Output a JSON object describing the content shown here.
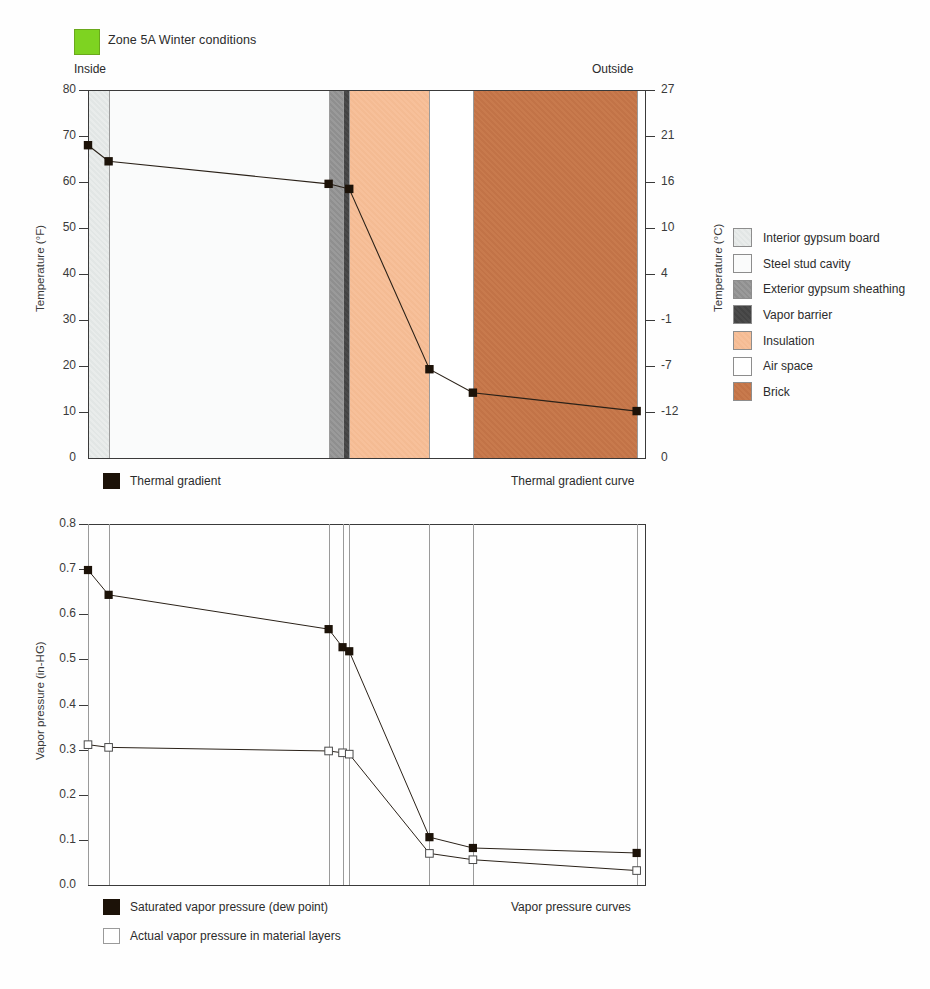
{
  "header": {
    "zone_label": "Zone 5A   Winter conditions",
    "zone_swatch_color": "#7ed321",
    "inside_label": "Inside",
    "outside_label": "Outside"
  },
  "material_legend": {
    "items": [
      {
        "label": "Interior gypsum board",
        "color": "#e6eae9",
        "swatch": "mat-gyp-int"
      },
      {
        "label": "Steel stud cavity",
        "color": "#fafbfb",
        "swatch": "mat-stud"
      },
      {
        "label": "Exterior gypsum sheathing",
        "color": "#959595",
        "swatch": "mat-gyp-ext"
      },
      {
        "label": "Vapor barrier",
        "color": "#474747",
        "swatch": "mat-vb"
      },
      {
        "label": "Insulation",
        "color": "#f5bd96",
        "swatch": "mat-ins"
      },
      {
        "label": "Air space",
        "color": "#ffffff",
        "swatch": "mat-air"
      },
      {
        "label": "Brick",
        "color": "#c5774a",
        "swatch": "mat-brick"
      }
    ]
  },
  "thermal_legend": {
    "series_label": "Thermal gradient",
    "caption": "Thermal gradient curve"
  },
  "vapor_legend": {
    "saturated_label": "Saturated vapor pressure (dew point)",
    "actual_label": "Actual vapor pressure in material layers",
    "caption": "Vapor pressure curves"
  },
  "chart_data": [
    {
      "type": "line",
      "title": "Thermal gradient curve",
      "xlabel": "",
      "ylabel": "Temperature (°F)",
      "ylabel_secondary": "Temperature (°C)",
      "ylim": [
        0,
        80
      ],
      "yticks": [
        0,
        10,
        20,
        30,
        40,
        50,
        60,
        70,
        80
      ],
      "yticklabels": [
        "0",
        "10",
        "20",
        "30",
        "40",
        "50",
        "60",
        "70",
        "80"
      ],
      "yticks_secondary_labels": [
        "0",
        "-12",
        "-7",
        "-1",
        "4",
        "10",
        "16",
        "21",
        "27"
      ],
      "grid": false,
      "legend_position": "below-left",
      "layers": [
        {
          "name": "Interior gypsum board",
          "x0": 0.0,
          "x1": 0.037
        },
        {
          "name": "Steel stud cavity",
          "x0": 0.037,
          "x1": 0.432
        },
        {
          "name": "Exterior gypsum sheathing",
          "x0": 0.432,
          "x1": 0.457
        },
        {
          "name": "Vapor barrier",
          "x0": 0.457,
          "x1": 0.469
        },
        {
          "name": "Insulation",
          "x0": 0.469,
          "x1": 0.613
        },
        {
          "name": "Air space",
          "x0": 0.613,
          "x1": 0.691
        },
        {
          "name": "Brick",
          "x0": 0.691,
          "x1": 0.985
        }
      ],
      "series": [
        {
          "name": "Thermal gradient",
          "marker": "filled-square",
          "x": [
            0.0,
            0.037,
            0.432,
            0.469,
            0.613,
            0.691,
            0.985
          ],
          "values": [
            68.0,
            64.5,
            59.6,
            58.5,
            19.3,
            14.2,
            10.2
          ]
        }
      ]
    },
    {
      "type": "line",
      "title": "Vapor pressure curves",
      "xlabel": "",
      "ylabel": "Vapor pressure (in-HG)",
      "ylim": [
        0.0,
        0.8
      ],
      "yticks": [
        0.0,
        0.1,
        0.2,
        0.3,
        0.4,
        0.5,
        0.6,
        0.7,
        0.8
      ],
      "yticklabels": [
        "0.0",
        "0.1",
        "0.2",
        "0.3",
        "0.4",
        "0.5",
        "0.6",
        "0.7",
        "0.8"
      ],
      "grid": true,
      "gridlines_x": [
        0.0,
        0.037,
        0.432,
        0.457,
        0.469,
        0.613,
        0.691,
        0.985
      ],
      "legend_position": "below-left",
      "series": [
        {
          "name": "Saturated vapor pressure (dew point)",
          "marker": "filled-square",
          "x": [
            0.0,
            0.037,
            0.432,
            0.457,
            0.469,
            0.613,
            0.691,
            0.985
          ],
          "values": [
            0.698,
            0.643,
            0.567,
            0.527,
            0.518,
            0.106,
            0.082,
            0.071
          ]
        },
        {
          "name": "Actual vapor pressure in material layers",
          "marker": "open-square",
          "x": [
            0.0,
            0.037,
            0.432,
            0.457,
            0.469,
            0.613,
            0.691,
            0.985
          ],
          "values": [
            0.311,
            0.305,
            0.297,
            0.293,
            0.29,
            0.07,
            0.056,
            0.032
          ]
        }
      ]
    }
  ]
}
